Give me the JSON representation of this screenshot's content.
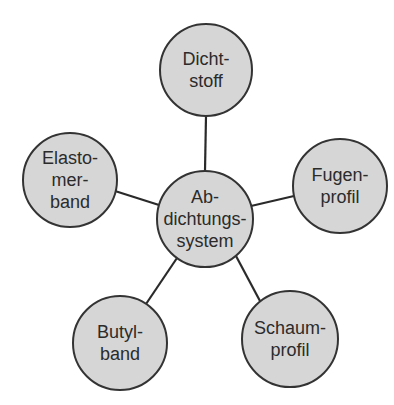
{
  "diagram": {
    "type": "mind-map",
    "center": {
      "id": "abdichtungssystem",
      "lines": [
        "Ab-",
        "dichtungs-",
        "system"
      ],
      "cx": 205,
      "cy": 219,
      "r": 48
    },
    "nodes": [
      {
        "id": "dichtstoff",
        "lines": [
          "Dicht-",
          "stoff"
        ],
        "cx": 206,
        "cy": 70,
        "r": 46
      },
      {
        "id": "fugenprofil",
        "lines": [
          "Fugen-",
          "profil"
        ],
        "cx": 340,
        "cy": 186,
        "r": 47
      },
      {
        "id": "schaumprofil",
        "lines": [
          "Schaum-",
          "profil"
        ],
        "cx": 290,
        "cy": 339,
        "r": 48
      },
      {
        "id": "butylband",
        "lines": [
          "Butyl-",
          "band"
        ],
        "cx": 120,
        "cy": 343,
        "r": 47
      },
      {
        "id": "elastomerband",
        "lines": [
          "Elasto-",
          "mer-",
          "band"
        ],
        "cx": 70,
        "cy": 180,
        "r": 47
      }
    ],
    "colors": {
      "fill": "#d6d6d6",
      "stroke": "#333333",
      "text": "#2b2b2b",
      "background": "#ffffff"
    }
  }
}
